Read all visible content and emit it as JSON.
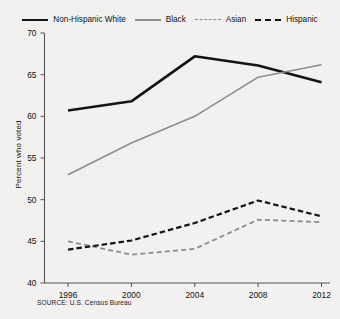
{
  "chart_data": {
    "type": "line",
    "title": "",
    "xlabel": "",
    "ylabel": "Percent who voted",
    "categories": [
      "1996",
      "2000",
      "2004",
      "2008",
      "2012"
    ],
    "x": [
      1996,
      2000,
      2004,
      2008,
      2012
    ],
    "ylim": [
      40,
      70
    ],
    "yticks": [
      40,
      45,
      50,
      55,
      60,
      65,
      70
    ],
    "ytick_labels": [
      "40",
      "45",
      "50",
      "55",
      "60",
      "65",
      "70"
    ],
    "grid": false,
    "legend_position": "top",
    "series": [
      {
        "name": "Non-Hispanic White",
        "values": [
          60.7,
          61.8,
          67.2,
          66.1,
          64.1
        ],
        "color": "#141414",
        "style": "solid",
        "width": "thick"
      },
      {
        "name": "Black",
        "values": [
          53.0,
          56.8,
          60.0,
          64.7,
          66.2
        ],
        "color": "#8c8c8c",
        "style": "solid",
        "width": "thin"
      },
      {
        "name": "Asian",
        "values": [
          45.0,
          43.4,
          44.1,
          47.6,
          47.3
        ],
        "color": "#8c8c8c",
        "style": "dashed",
        "width": "thin"
      },
      {
        "name": "Hispanic",
        "values": [
          44.0,
          45.1,
          47.2,
          49.9,
          48.0
        ],
        "color": "#141414",
        "style": "dashed",
        "width": "thick"
      }
    ],
    "source": "SOURCE: U.S. Census Bureau"
  },
  "legend": {
    "items": [
      {
        "label": "Non-Hispanic White"
      },
      {
        "label": "Black"
      },
      {
        "label": "Asian"
      },
      {
        "label": "Hispanic"
      }
    ]
  },
  "axes": {
    "y_title": "Percent who voted"
  },
  "footer": {
    "source": "SOURCE: U.S. Census Bureau"
  }
}
